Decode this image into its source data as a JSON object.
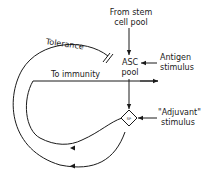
{
  "diagram": {
    "labels": {
      "from_stem_line1": "From stem",
      "from_stem_line2": "cell pool",
      "antigen_line1": "Antigen",
      "antigen_line2": "stimulus",
      "asc_line1": "ASC",
      "asc_line2": "pool",
      "tolerance": "Tolerance",
      "to_immunity": "To immunity",
      "adjuvant_line1": "\"Adjuvant\"",
      "adjuvant_line2": "stimulus",
      "sp": "SP"
    },
    "nodes": [
      "ASC pool",
      "SP"
    ],
    "edges": [
      {
        "from": "From stem cell pool",
        "to": "ASC pool"
      },
      {
        "from": "Antigen stimulus",
        "to": "ASC pool"
      },
      {
        "from": "ASC pool",
        "to": "SP"
      },
      {
        "from": "Adjuvant stimulus",
        "to": "SP"
      },
      {
        "from": "SP",
        "to": "ASC pool",
        "label": "Tolerance",
        "type": "inhibition"
      },
      {
        "from": "SP",
        "to": "To immunity"
      }
    ],
    "colors": {
      "ink": "#1a1a1a",
      "background": "#ffffff"
    }
  }
}
